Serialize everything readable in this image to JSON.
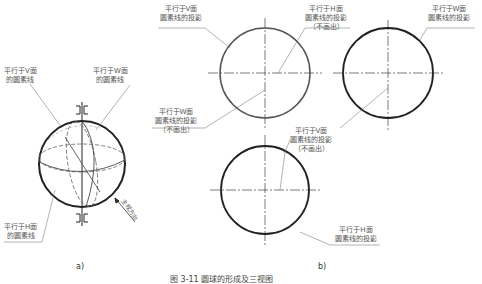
{
  "figure": {
    "caption": "图 3-11 圆球的形成及三视图",
    "panels": [
      {
        "id": "a",
        "sub_label": "a)",
        "labels": [
          {
            "line1": "平行于V面",
            "line2": "的圆素线"
          },
          {
            "line1": "平行于W面",
            "line2": "的圆素线"
          },
          {
            "line1": "平行于H面",
            "line2": "的圆素线"
          }
        ],
        "direction_label": "主视方向"
      },
      {
        "id": "b",
        "sub_label": "b)",
        "labels": [
          {
            "line1": "平行于V面",
            "line2": "圆素线的投影",
            "line3": ""
          },
          {
            "line1": "平行于H面",
            "line2": "圆素线的投影",
            "line3": "（不画出）"
          },
          {
            "line1": "平行于W面",
            "line2": "圆素线的投影",
            "line3": ""
          },
          {
            "line1": "平行于W面",
            "line2": "圆素线的投影",
            "line3": "（不画出）"
          },
          {
            "line1": "平行于V面",
            "line2": "圆素线的投影",
            "line3": "（不画出）"
          },
          {
            "line1": "平行于H面",
            "line2": "圆素线的投影",
            "line3": ""
          }
        ]
      }
    ]
  }
}
